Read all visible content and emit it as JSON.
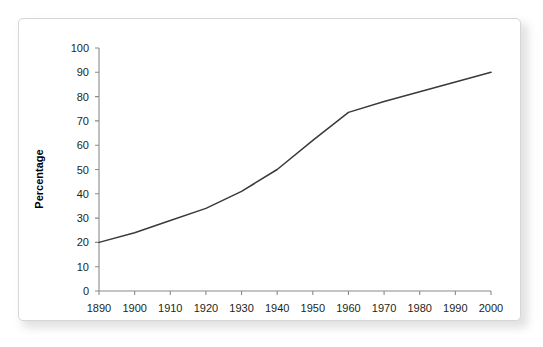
{
  "card": {
    "background_color": "#ffffff",
    "border_color": "#d6d6d6"
  },
  "chart_data": {
    "type": "line",
    "title": "",
    "subtitle": "",
    "xlabel": "",
    "ylabel": "Percentage",
    "x": [
      1890,
      1900,
      1910,
      1920,
      1930,
      1940,
      1950,
      1960,
      1970,
      1980,
      1990,
      2000
    ],
    "values": [
      20,
      24,
      29,
      34,
      41,
      50,
      62,
      73.5,
      78,
      82,
      86,
      90
    ],
    "series": [
      {
        "name": "Percentage",
        "color": "#3a3a3a",
        "values": [
          20,
          24,
          29,
          34,
          41,
          50,
          62,
          73.5,
          78,
          82,
          86,
          90
        ]
      }
    ],
    "xlim": [
      1890,
      2000
    ],
    "ylim": [
      0,
      100
    ],
    "x_tick_labels": [
      "1890",
      "1900",
      "1910",
      "1920",
      "1930",
      "1940",
      "1950",
      "1960",
      "1970",
      "1980",
      "1990",
      "2000"
    ],
    "y_tick_labels": [
      "0",
      "10",
      "20",
      "30",
      "40",
      "50",
      "60",
      "70",
      "80",
      "90",
      "100"
    ],
    "y_ticks": [
      0,
      10,
      20,
      30,
      40,
      50,
      60,
      70,
      80,
      90,
      100
    ],
    "grid": false,
    "legend": false,
    "legend_position": "none",
    "markers": false,
    "annotations": []
  }
}
